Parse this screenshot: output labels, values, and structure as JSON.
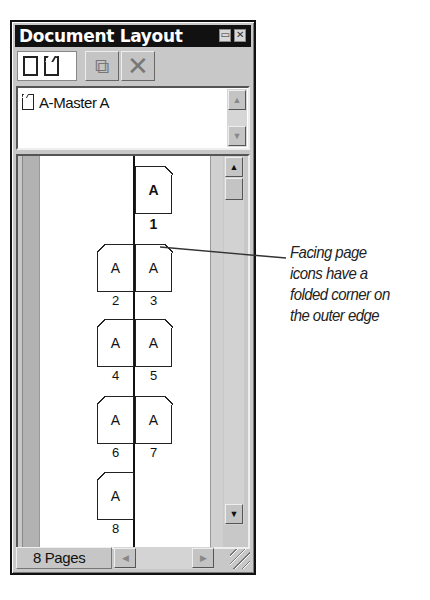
{
  "window": {
    "title": "Document Layout",
    "title_buttons": [
      {
        "name": "minimize",
        "glyph": "▭"
      },
      {
        "name": "close",
        "glyph": "✕"
      }
    ]
  },
  "toolbar": {
    "page_types": [
      {
        "name": "single-page",
        "icon": "single-page-icon"
      },
      {
        "name": "facing-pages",
        "icon": "facing-page-icon"
      }
    ],
    "duplicate_icon": "⧉",
    "delete_icon": "✕"
  },
  "masters": {
    "items": [
      {
        "label": "A-Master A",
        "icon": "master-page-icon"
      }
    ],
    "scroll_up": "▲",
    "scroll_down": "▼"
  },
  "pages": {
    "scroll_up": "▲",
    "scroll_down": "▼",
    "items": [
      {
        "number": "1",
        "master": "A",
        "side": "right",
        "selected": true
      },
      {
        "number": "2",
        "master": "A",
        "side": "left"
      },
      {
        "number": "3",
        "master": "A",
        "side": "right"
      },
      {
        "number": "4",
        "master": "A",
        "side": "left"
      },
      {
        "number": "5",
        "master": "A",
        "side": "right"
      },
      {
        "number": "6",
        "master": "A",
        "side": "left"
      },
      {
        "number": "7",
        "master": "A",
        "side": "right"
      },
      {
        "number": "8",
        "master": "A",
        "side": "left"
      }
    ]
  },
  "status": {
    "page_count": "8 Pages",
    "scroll_left": "◀",
    "scroll_right": "▶"
  },
  "callout": {
    "text": "Facing page icons have a folded corner on the outer edge",
    "lines": [
      "Facing page",
      "icons have a",
      "folded corner on",
      "the outer edge"
    ]
  }
}
